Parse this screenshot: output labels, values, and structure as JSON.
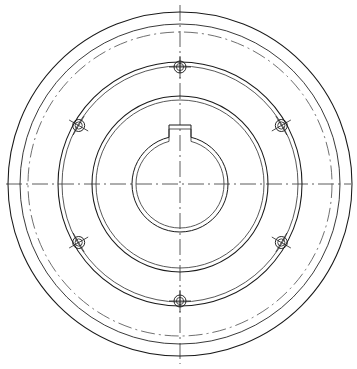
{
  "drawing": {
    "type": "mechanical-part-front-view",
    "part": "flange hub / coupling with keyed bore",
    "title": "",
    "background_color": "#ffffff",
    "line_color": "#1a1a1a",
    "centerline_color": "#4a4a4a",
    "canvas": {
      "width": 357,
      "height": 369
    },
    "center": {
      "x": 180,
      "y": 184
    },
    "circles": [
      {
        "name": "outer-rim-circle",
        "r": 172,
        "style": "solid"
      },
      {
        "name": "second-rim-circle",
        "r": 160,
        "style": "solid"
      },
      {
        "name": "bolt-pitch-circle",
        "r": 152,
        "style": "dash-dot"
      },
      {
        "name": "hub-outer-circle",
        "r": 122,
        "style": "solid"
      },
      {
        "name": "hub-outer-circle-inner",
        "r": 118,
        "style": "solid"
      },
      {
        "name": "boss-outer-circle",
        "r": 88,
        "style": "solid"
      },
      {
        "name": "boss-outer-circle-inner",
        "r": 84,
        "style": "solid"
      },
      {
        "name": "bore-circle",
        "r": 48,
        "style": "solid"
      },
      {
        "name": "bore-circle-inner",
        "r": 44,
        "style": "solid"
      }
    ],
    "bolt_holes": {
      "count": 6,
      "pitch_radius": 117,
      "hole_radius": 6,
      "inner_radius": 4,
      "angles_deg": [
        90,
        150,
        210,
        270,
        330,
        30
      ],
      "positions": [
        {
          "name": "bolt-hole-top",
          "angle": 90
        },
        {
          "name": "bolt-hole-upper-left",
          "angle": 150
        },
        {
          "name": "bolt-hole-lower-left",
          "angle": 210
        },
        {
          "name": "bolt-hole-bottom",
          "angle": 270
        },
        {
          "name": "bolt-hole-lower-right",
          "angle": 330
        },
        {
          "name": "bolt-hole-upper-right",
          "angle": 30
        }
      ]
    },
    "keyway": {
      "name": "keyway-slot",
      "position": "top-of-bore",
      "width": 22,
      "depth": 11
    },
    "centerlines": [
      {
        "name": "horizontal-centerline",
        "orientation": "horizontal",
        "extent": 352
      },
      {
        "name": "vertical-centerline",
        "orientation": "vertical",
        "extent": 360
      }
    ]
  }
}
